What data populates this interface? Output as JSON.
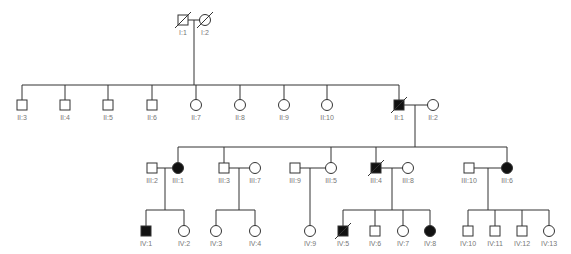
{
  "colors": {
    "line": "#333333",
    "affected": "#111111",
    "unaffected": "#ffffff",
    "label": "#777777"
  },
  "legend_semantics": {
    "square": "male",
    "circle": "female",
    "filled": "affected",
    "slash": "deceased"
  },
  "individuals": [
    {
      "id": "I:1",
      "sex": "male",
      "affected": false,
      "deceased": true,
      "x": 183,
      "y": 20
    },
    {
      "id": "I:2",
      "sex": "female",
      "affected": false,
      "deceased": true,
      "x": 205,
      "y": 20
    },
    {
      "id": "II:3",
      "sex": "male",
      "affected": false,
      "deceased": false,
      "x": 22,
      "y": 105
    },
    {
      "id": "II:4",
      "sex": "male",
      "affected": false,
      "deceased": false,
      "x": 65,
      "y": 105
    },
    {
      "id": "II:5",
      "sex": "male",
      "affected": false,
      "deceased": false,
      "x": 108,
      "y": 105
    },
    {
      "id": "II:6",
      "sex": "male",
      "affected": false,
      "deceased": false,
      "x": 152,
      "y": 105
    },
    {
      "id": "II:7",
      "sex": "female",
      "affected": false,
      "deceased": false,
      "x": 196,
      "y": 105
    },
    {
      "id": "II:8",
      "sex": "female",
      "affected": false,
      "deceased": false,
      "x": 240,
      "y": 105
    },
    {
      "id": "II:9",
      "sex": "female",
      "affected": false,
      "deceased": false,
      "x": 284,
      "y": 105
    },
    {
      "id": "II:10",
      "sex": "female",
      "affected": false,
      "deceased": false,
      "x": 327,
      "y": 105
    },
    {
      "id": "II:1",
      "sex": "male",
      "affected": true,
      "deceased": true,
      "x": 399,
      "y": 105
    },
    {
      "id": "II:2",
      "sex": "female",
      "affected": false,
      "deceased": false,
      "x": 433,
      "y": 105
    },
    {
      "id": "III:2",
      "sex": "male",
      "affected": false,
      "deceased": false,
      "x": 152,
      "y": 168
    },
    {
      "id": "III:1",
      "sex": "female",
      "affected": true,
      "deceased": false,
      "x": 178,
      "y": 168
    },
    {
      "id": "III:3",
      "sex": "male",
      "affected": false,
      "deceased": false,
      "x": 224,
      "y": 168
    },
    {
      "id": "III:7",
      "sex": "female",
      "affected": false,
      "deceased": false,
      "x": 255,
      "y": 168
    },
    {
      "id": "III:9",
      "sex": "male",
      "affected": false,
      "deceased": false,
      "x": 295,
      "y": 168
    },
    {
      "id": "III:5",
      "sex": "female",
      "affected": false,
      "deceased": false,
      "x": 331,
      "y": 168
    },
    {
      "id": "III:4",
      "sex": "male",
      "affected": true,
      "deceased": true,
      "x": 376,
      "y": 168
    },
    {
      "id": "III:8",
      "sex": "female",
      "affected": false,
      "deceased": false,
      "x": 408,
      "y": 168
    },
    {
      "id": "III:10",
      "sex": "male",
      "affected": false,
      "deceased": false,
      "x": 469,
      "y": 168
    },
    {
      "id": "III:6",
      "sex": "female",
      "affected": true,
      "deceased": false,
      "x": 507,
      "y": 168
    },
    {
      "id": "IV:1",
      "sex": "male",
      "affected": true,
      "deceased": false,
      "x": 146,
      "y": 231
    },
    {
      "id": "IV:2",
      "sex": "female",
      "affected": false,
      "deceased": false,
      "x": 184,
      "y": 231
    },
    {
      "id": "IV:3",
      "sex": "female",
      "affected": false,
      "deceased": false,
      "x": 216,
      "y": 231
    },
    {
      "id": "IV:4",
      "sex": "female",
      "affected": false,
      "deceased": false,
      "x": 255,
      "y": 231
    },
    {
      "id": "IV:9",
      "sex": "female",
      "affected": false,
      "deceased": false,
      "x": 310,
      "y": 231
    },
    {
      "id": "IV:5",
      "sex": "male",
      "affected": true,
      "deceased": true,
      "x": 343,
      "y": 231
    },
    {
      "id": "IV:6",
      "sex": "male",
      "affected": false,
      "deceased": false,
      "x": 375,
      "y": 231
    },
    {
      "id": "IV:7",
      "sex": "female",
      "affected": false,
      "deceased": false,
      "x": 403,
      "y": 231
    },
    {
      "id": "IV:8",
      "sex": "female",
      "affected": true,
      "deceased": false,
      "x": 430,
      "y": 231
    },
    {
      "id": "IV:10",
      "sex": "male",
      "affected": false,
      "deceased": false,
      "x": 468,
      "y": 231
    },
    {
      "id": "IV:11",
      "sex": "male",
      "affected": false,
      "deceased": false,
      "x": 495,
      "y": 231
    },
    {
      "id": "IV:12",
      "sex": "male",
      "affected": false,
      "deceased": false,
      "x": 522,
      "y": 231
    },
    {
      "id": "IV:13",
      "sex": "female",
      "affected": false,
      "deceased": false,
      "x": 549,
      "y": 231
    }
  ],
  "lines": [
    [
      188,
      20,
      200,
      20
    ],
    [
      194,
      20,
      194,
      85
    ],
    [
      22,
      85,
      399,
      85
    ],
    [
      22,
      85,
      22,
      100
    ],
    [
      65,
      85,
      65,
      100
    ],
    [
      108,
      85,
      108,
      100
    ],
    [
      152,
      85,
      152,
      100
    ],
    [
      196,
      85,
      196,
      100
    ],
    [
      240,
      85,
      240,
      100
    ],
    [
      284,
      85,
      284,
      100
    ],
    [
      327,
      85,
      327,
      100
    ],
    [
      399,
      85,
      399,
      100
    ],
    [
      404,
      105,
      428,
      105
    ],
    [
      415,
      105,
      415,
      147
    ],
    [
      178,
      147,
      507,
      147
    ],
    [
      178,
      147,
      178,
      163
    ],
    [
      224,
      147,
      224,
      163
    ],
    [
      331,
      147,
      331,
      163
    ],
    [
      376,
      147,
      376,
      163
    ],
    [
      507,
      147,
      507,
      163
    ],
    [
      157,
      168,
      173,
      168
    ],
    [
      165,
      168,
      165,
      210
    ],
    [
      146,
      210,
      184,
      210
    ],
    [
      146,
      210,
      146,
      226
    ],
    [
      184,
      210,
      184,
      226
    ],
    [
      229,
      168,
      250,
      168
    ],
    [
      239,
      168,
      239,
      210
    ],
    [
      216,
      210,
      255,
      210
    ],
    [
      216,
      210,
      216,
      226
    ],
    [
      255,
      210,
      255,
      226
    ],
    [
      300,
      168,
      326,
      168
    ],
    [
      310,
      168,
      310,
      226
    ],
    [
      381,
      168,
      403,
      168
    ],
    [
      392,
      168,
      392,
      210
    ],
    [
      343,
      210,
      430,
      210
    ],
    [
      343,
      210,
      343,
      226
    ],
    [
      375,
      210,
      375,
      226
    ],
    [
      403,
      210,
      403,
      226
    ],
    [
      430,
      210,
      430,
      226
    ],
    [
      474,
      168,
      502,
      168
    ],
    [
      488,
      168,
      488,
      210
    ],
    [
      468,
      210,
      549,
      210
    ],
    [
      468,
      210,
      468,
      226
    ],
    [
      495,
      210,
      495,
      226
    ],
    [
      522,
      210,
      522,
      226
    ],
    [
      549,
      210,
      549,
      226
    ]
  ]
}
